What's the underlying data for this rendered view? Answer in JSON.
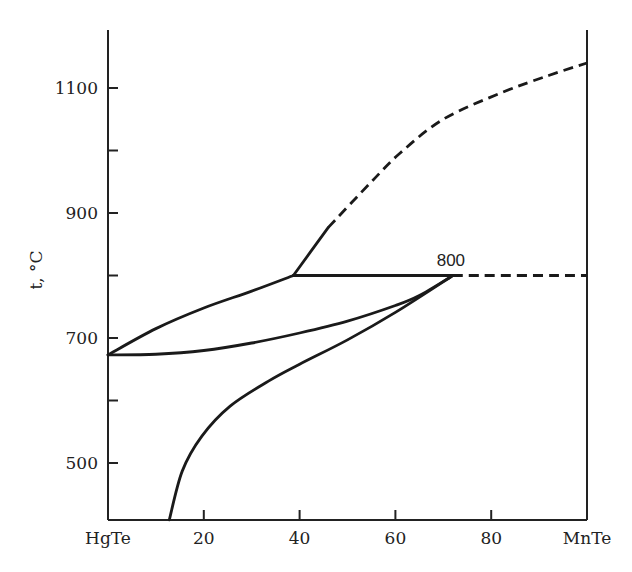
{
  "chart_data": {
    "type": "line",
    "title": "",
    "xlabel": "",
    "ylabel": "t, °C",
    "xlim": [
      0,
      100
    ],
    "ylim": [
      409,
      1161
    ],
    "grid": false,
    "x_ticks": [
      {
        "value": 0,
        "label": "HgTe"
      },
      {
        "value": 20,
        "label": "20"
      },
      {
        "value": 40,
        "label": "40"
      },
      {
        "value": 60,
        "label": "60"
      },
      {
        "value": 80,
        "label": "80"
      },
      {
        "value": 100,
        "label": "MnTe"
      }
    ],
    "y_ticks": [
      {
        "value": 500,
        "label": "500"
      },
      {
        "value": 600,
        "label": ""
      },
      {
        "value": 700,
        "label": "700"
      },
      {
        "value": 800,
        "label": ""
      },
      {
        "value": 900,
        "label": "900"
      },
      {
        "value": 1000,
        "label": ""
      },
      {
        "value": 1100,
        "label": "1100"
      }
    ],
    "annotations": [
      {
        "text": "800",
        "x": 72,
        "y": 800
      }
    ],
    "series": [
      {
        "name": "liquidus (HgTe side)",
        "style": "solid",
        "x": [
          0,
          10,
          20,
          30,
          38.7
        ],
        "y": [
          673,
          715,
          748,
          775,
          800
        ]
      },
      {
        "name": "solidus",
        "style": "solid",
        "x": [
          0,
          10,
          20,
          30,
          40,
          50,
          60,
          65,
          72
        ],
        "y": [
          673,
          674,
          680,
          692,
          708,
          727,
          752,
          768,
          800
        ]
      },
      {
        "name": "solvus",
        "style": "solid",
        "x": [
          12.8,
          15.5,
          19.6,
          25.5,
          33.5,
          40,
          50,
          60,
          72
        ],
        "y": [
          409,
          487,
          543,
          591,
          631,
          658,
          697,
          741,
          800
        ]
      },
      {
        "name": "peritectic isotherm",
        "style": "solid",
        "x": [
          38.7,
          72
        ],
        "y": [
          800,
          800
        ]
      },
      {
        "name": "peritectic isotherm (extrapolated)",
        "style": "dashed",
        "x": [
          72,
          100
        ],
        "y": [
          800,
          800
        ]
      },
      {
        "name": "liquidus (MnTe side)",
        "style": "solid",
        "x": [
          38.7,
          46
        ],
        "y": [
          800,
          877
        ]
      },
      {
        "name": "liquidus (MnTe side, estimated)",
        "style": "dashed",
        "x": [
          46,
          55,
          61,
          70,
          82,
          92,
          100
        ],
        "y": [
          877,
          950,
          996,
          1050,
          1092,
          1120,
          1140
        ]
      }
    ]
  }
}
